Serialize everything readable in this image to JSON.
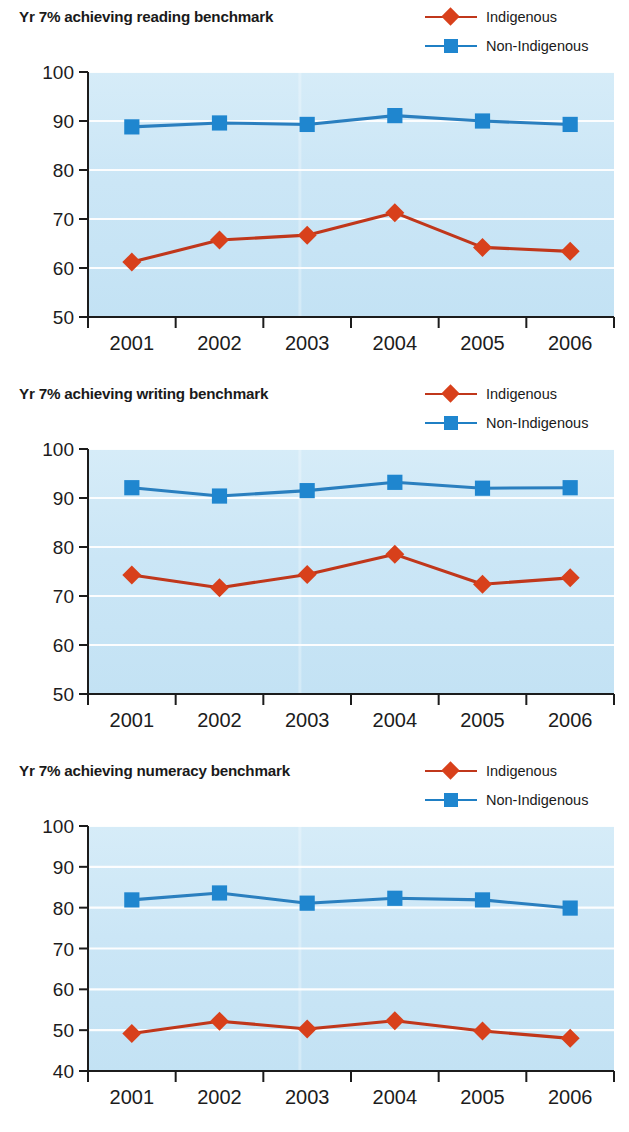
{
  "legend": {
    "entries": [
      {
        "label": "Indigenous",
        "marker": "diamond-marker-icon",
        "color": "#d8401b"
      },
      {
        "label": "Non-Indigenous",
        "marker": "square-marker-icon",
        "color": "#1f86cf"
      }
    ]
  },
  "colors": {
    "indigenous": "#d8401b",
    "indigenous_line": "#c0371b",
    "non_indigenous": "#1f86cf",
    "non_indigenous_line": "#2a7fbf",
    "plot_background": "#cfe7f5",
    "gridline": "#ffffff",
    "axis": "#1c1c1c",
    "text": "#1a1a1a"
  },
  "chart_data": [
    {
      "type": "line",
      "title": "Yr 7% achieving reading benchmark",
      "xlabel": "",
      "ylabel": "",
      "categories": [
        "2001",
        "2002",
        "2003",
        "2004",
        "2005",
        "2006"
      ],
      "ylim": [
        50,
        100
      ],
      "yticks": [
        50,
        60,
        70,
        80,
        90,
        100
      ],
      "grid": true,
      "legend_position": "top-right",
      "series": [
        {
          "name": "Indigenous",
          "color": "#d8401b",
          "marker": "diamond",
          "values": [
            61.2,
            65.7,
            66.7,
            71.3,
            64.2,
            63.4
          ]
        },
        {
          "name": "Non-Indigenous",
          "color": "#1f86cf",
          "marker": "square",
          "values": [
            88.8,
            89.6,
            89.3,
            91.1,
            90.0,
            89.3
          ]
        }
      ]
    },
    {
      "type": "line",
      "title": "Yr 7% achieving writing benchmark",
      "xlabel": "",
      "ylabel": "",
      "categories": [
        "2001",
        "2002",
        "2003",
        "2004",
        "2005",
        "2006"
      ],
      "ylim": [
        50,
        100
      ],
      "yticks": [
        50,
        60,
        70,
        80,
        90,
        100
      ],
      "grid": true,
      "legend_position": "top-right",
      "series": [
        {
          "name": "Indigenous",
          "color": "#d8401b",
          "marker": "diamond",
          "values": [
            74.3,
            71.7,
            74.4,
            78.5,
            72.4,
            73.7
          ]
        },
        {
          "name": "Non-Indigenous",
          "color": "#1f86cf",
          "marker": "square",
          "values": [
            92.1,
            90.4,
            91.5,
            93.2,
            92.0,
            92.1
          ]
        }
      ]
    },
    {
      "type": "line",
      "title": "Yr 7% achieving numeracy benchmark",
      "xlabel": "",
      "ylabel": "",
      "categories": [
        "2001",
        "2002",
        "2003",
        "2004",
        "2005",
        "2006"
      ],
      "ylim": [
        40,
        100
      ],
      "yticks": [
        40,
        50,
        60,
        70,
        80,
        90,
        100
      ],
      "grid": true,
      "legend_position": "top-right",
      "series": [
        {
          "name": "Indigenous",
          "color": "#d8401b",
          "marker": "diamond",
          "values": [
            49.2,
            52.2,
            50.3,
            52.3,
            49.8,
            48.0
          ]
        },
        {
          "name": "Non-Indigenous",
          "color": "#1f86cf",
          "marker": "square",
          "values": [
            81.9,
            83.6,
            81.1,
            82.3,
            81.9,
            79.9
          ]
        }
      ]
    }
  ]
}
